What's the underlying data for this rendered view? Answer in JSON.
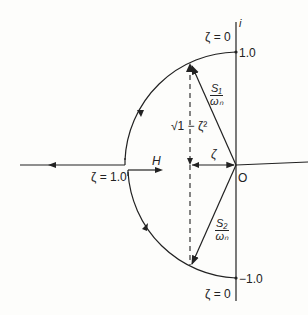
{
  "diagram": {
    "axis_imag_label": "i",
    "origin_label": "O",
    "top_value": "1.0",
    "bottom_value": "−1.0",
    "zeta_top": "ζ = 0",
    "zeta_bottom": "ζ = 0",
    "zeta_one": "ζ = 1.0",
    "zeta_segment": "ζ",
    "h_label": "H",
    "sqrt_label": "√1 − ζ²",
    "s1_num": "S₁",
    "s1_den": "ωₙ",
    "s2_num": "S₂",
    "s2_den": "ωₙ",
    "colors": {
      "ink": "#222222",
      "paper": "#fdfdfb"
    }
  }
}
